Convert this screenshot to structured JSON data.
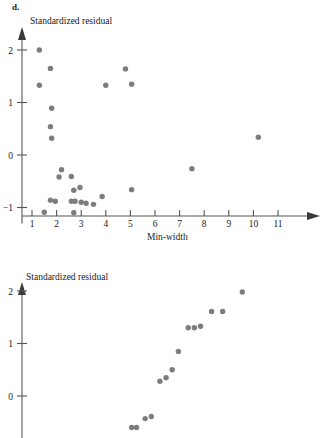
{
  "panel": {
    "label": "d."
  },
  "charts": [
    {
      "name": "min-width-residual-plot",
      "ylabel": "Standardized residual",
      "xlabel": "Min-width",
      "xticks": [
        "1",
        "2",
        "3",
        "4",
        "5",
        "6",
        "7",
        "8",
        "9",
        "10",
        "11"
      ],
      "yticks": [
        "2",
        "1",
        "0",
        "-1"
      ]
    },
    {
      "name": "normal-probability-plot",
      "ylabel": "Standardized residual",
      "xlabel": "",
      "xticks": [],
      "yticks": [
        "2",
        "1",
        "0"
      ]
    }
  ],
  "chart_data": [
    {
      "type": "scatter",
      "title": "",
      "xlabel": "Min-width",
      "ylabel": "Standardized residual",
      "xlim": [
        0.7,
        11.6
      ],
      "ylim": [
        -1.35,
        2.25
      ],
      "xticks": [
        1,
        2,
        3,
        4,
        5,
        6,
        7,
        8,
        9,
        10,
        11
      ],
      "yticks": [
        -1,
        0,
        1,
        2
      ],
      "grid": false,
      "legend": false,
      "points": [
        {
          "x": 1.3,
          "y": 2.0
        },
        {
          "x": 1.3,
          "y": 1.33
        },
        {
          "x": 1.75,
          "y": 1.65
        },
        {
          "x": 1.8,
          "y": 0.89
        },
        {
          "x": 1.75,
          "y": 0.54
        },
        {
          "x": 1.8,
          "y": 0.32
        },
        {
          "x": 1.5,
          "y": -1.09
        },
        {
          "x": 1.75,
          "y": -0.86
        },
        {
          "x": 1.95,
          "y": -0.88
        },
        {
          "x": 2.2,
          "y": -0.28
        },
        {
          "x": 2.1,
          "y": -0.42
        },
        {
          "x": 2.6,
          "y": -0.41
        },
        {
          "x": 2.7,
          "y": -0.67
        },
        {
          "x": 2.95,
          "y": -0.62
        },
        {
          "x": 2.6,
          "y": -0.88
        },
        {
          "x": 2.75,
          "y": -0.88
        },
        {
          "x": 2.7,
          "y": -1.1
        },
        {
          "x": 3.0,
          "y": -0.9
        },
        {
          "x": 3.2,
          "y": -0.92
        },
        {
          "x": 3.5,
          "y": -0.94
        },
        {
          "x": 3.85,
          "y": -0.79
        },
        {
          "x": 4.0,
          "y": 1.33
        },
        {
          "x": 4.8,
          "y": 1.64
        },
        {
          "x": 5.05,
          "y": 1.35
        },
        {
          "x": 5.05,
          "y": -0.66
        },
        {
          "x": 7.5,
          "y": -0.26
        },
        {
          "x": 10.2,
          "y": 0.34
        }
      ]
    },
    {
      "type": "scatter",
      "title": "",
      "xlabel": "",
      "ylabel": "Standardized residual",
      "xlim": [
        0,
        11.6
      ],
      "ylim": [
        -0.75,
        2.25
      ],
      "yticks": [
        0,
        1,
        2
      ],
      "grid": false,
      "legend": false,
      "points": [
        {
          "x": 5.05,
          "y": -0.6
        },
        {
          "x": 5.25,
          "y": -0.6
        },
        {
          "x": 5.6,
          "y": -0.43
        },
        {
          "x": 5.85,
          "y": -0.39
        },
        {
          "x": 6.2,
          "y": 0.28
        },
        {
          "x": 6.45,
          "y": 0.35
        },
        {
          "x": 6.7,
          "y": 0.5
        },
        {
          "x": 6.95,
          "y": 0.85
        },
        {
          "x": 7.35,
          "y": 1.3
        },
        {
          "x": 7.6,
          "y": 1.3
        },
        {
          "x": 7.85,
          "y": 1.33
        },
        {
          "x": 8.3,
          "y": 1.61
        },
        {
          "x": 8.75,
          "y": 1.61
        },
        {
          "x": 9.55,
          "y": 1.98
        }
      ]
    }
  ]
}
